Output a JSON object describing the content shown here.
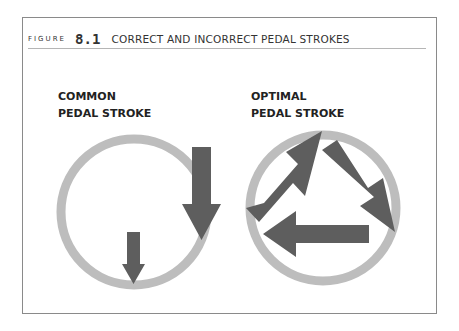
{
  "figure": {
    "label": "FIGURE",
    "number": "8.1",
    "title": "CORRECT AND INCORRECT PEDAL STROKES"
  },
  "panels": [
    {
      "line1": "COMMON",
      "line2": "PEDAL STROKE",
      "arrows": 2
    },
    {
      "line1": "OPTIMAL",
      "line2": "PEDAL STROKE",
      "arrows": 3
    }
  ],
  "colors": {
    "ring": "#bdbdbd",
    "arrow": "#5e5e5e",
    "frame": "#8a8a8a",
    "text": "#222222"
  }
}
